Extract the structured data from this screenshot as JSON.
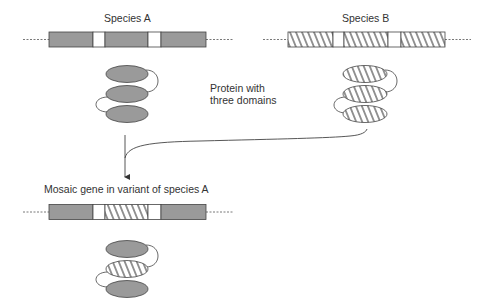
{
  "labels": {
    "species_a": "Species A",
    "species_b": "Species B",
    "protein_line1": "Protein with",
    "protein_line2": "three domains",
    "mosaic": "Mosaic gene in variant of species A"
  },
  "colors": {
    "gray_fill": "#9a9a9a",
    "outline": "#444444",
    "background": "#ffffff"
  },
  "genes": {
    "species_a": [
      "gray",
      "white",
      "gray",
      "white",
      "gray"
    ],
    "species_b": [
      "hatched",
      "white",
      "hatched",
      "white",
      "hatched"
    ],
    "mosaic": [
      "gray",
      "white",
      "hatched",
      "white",
      "gray"
    ]
  },
  "proteins": {
    "species_a": [
      "gray",
      "gray",
      "gray"
    ],
    "species_b": [
      "hatched",
      "hatched",
      "hatched"
    ],
    "mosaic": [
      "gray",
      "hatched",
      "gray"
    ]
  }
}
